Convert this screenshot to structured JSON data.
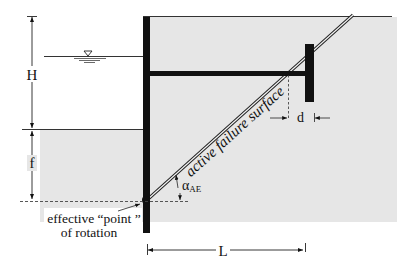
{
  "diagram": {
    "type": "anchored sheet pile wall with tie rod and anchor plate",
    "colors": {
      "soil": "#e6e6e6",
      "structure": "#111111",
      "line": "#222222",
      "background": "#ffffff"
    },
    "labels": {
      "height": "H",
      "embedment": "f",
      "anchor_offset": "d",
      "anchor_distance": "L",
      "failure_surface": "active failure surface",
      "angle_symbol": "α",
      "angle_subscript": "AE",
      "rotation_point_line1": "effective “point ”",
      "rotation_point_line2": "of rotation"
    },
    "elements": [
      {
        "name": "sheet-pile-wall"
      },
      {
        "name": "tie-rod"
      },
      {
        "name": "anchor-plate"
      },
      {
        "name": "water-table-symbol"
      },
      {
        "name": "dredge-line"
      },
      {
        "name": "ground-surface"
      },
      {
        "name": "active-failure-surface"
      },
      {
        "name": "rotation-point"
      }
    ]
  }
}
